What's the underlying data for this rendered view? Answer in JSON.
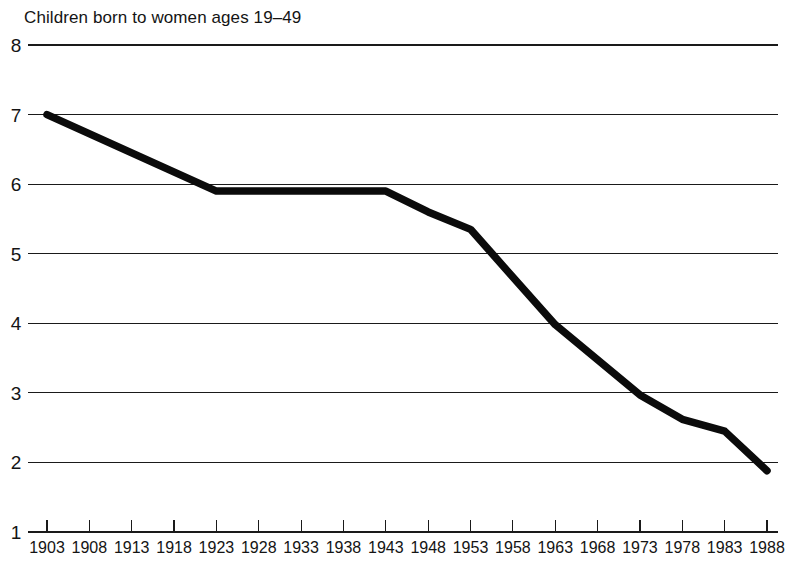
{
  "chart_data": {
    "type": "line",
    "title": "Children born to women ages 19–49",
    "xlabel": "",
    "ylabel": "",
    "xlim": [
      1903,
      1988
    ],
    "ylim": [
      1,
      8
    ],
    "grid": true,
    "legend": "none",
    "series_color": "#0b0b0b",
    "x_tick_labels": [
      "1903",
      "1908",
      "1913",
      "1918",
      "1923",
      "1928",
      "1933",
      "1938",
      "1943",
      "1948",
      "1953",
      "1958",
      "1963",
      "1968",
      "1973",
      "1978",
      "1983",
      "1988"
    ],
    "y_tick_labels": [
      "8",
      "7",
      "6",
      "5",
      "4",
      "3",
      "2",
      "1"
    ],
    "x": [
      1903,
      1923,
      1943,
      1948,
      1953,
      1963,
      1973,
      1978,
      1983,
      1988
    ],
    "values": [
      7.0,
      5.9,
      5.9,
      5.6,
      5.35,
      3.98,
      2.97,
      2.62,
      2.45,
      1.88
    ],
    "series": [
      {
        "name": "Children born to women ages 19-49",
        "x": [
          1903,
          1923,
          1943,
          1948,
          1953,
          1963,
          1973,
          1978,
          1983,
          1988
        ],
        "values": [
          7.0,
          5.9,
          5.9,
          5.6,
          5.35,
          3.98,
          2.97,
          2.62,
          2.45,
          1.88
        ]
      }
    ]
  }
}
